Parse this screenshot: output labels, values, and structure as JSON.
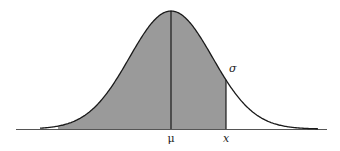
{
  "figure": {
    "type": "normal-distribution-curve",
    "labels": {
      "mean": "μ",
      "value": "x",
      "std_dev": "σ"
    },
    "colors": {
      "curve": "#1a1a1a",
      "shade": "#9a9a9a",
      "axis": "#555555"
    },
    "geometry": {
      "baseline_y": 129,
      "axis_x_start": 16,
      "axis_x_end": 327,
      "mean_px": 171,
      "peak_y": 11,
      "sigma_px": 41.5,
      "x_px": 226,
      "shade_start_px": 58
    }
  }
}
